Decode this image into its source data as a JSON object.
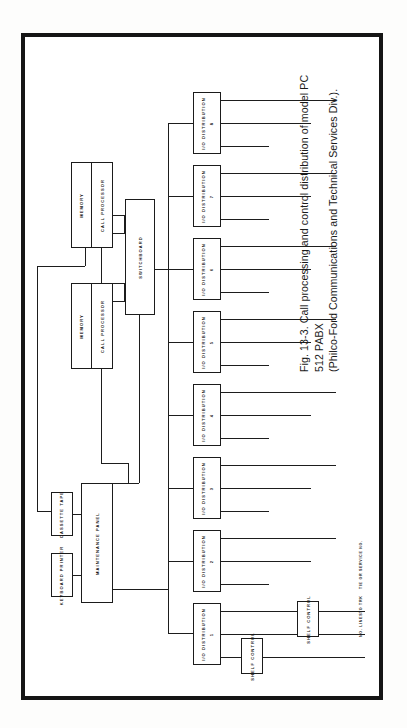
{
  "figure": {
    "caption_line1": "Fig. 13-3. Call processing and control distribution of model PC 512 PABX",
    "caption_line2": "(Philco-Ford Communications and Technical Services Div.)."
  },
  "blocks": {
    "memory_top": "MEMORY",
    "call_processor_top": "CALL PROCESSOR",
    "memory_bottom": "MEMORY",
    "call_processor_bottom": "CALL PROCESSOR",
    "switchboard": "SWITCHBOARD",
    "cassette_tape": "CASSETTE TAPE",
    "keyboard_printer": "KEYBOARD PRINTER",
    "maintenance_panel": "MAINTENANCE PANEL",
    "shelf_control_1": "SHELF CONTROL",
    "shelf_control_2": "SHELF CONTROL"
  },
  "io_distribution": [
    {
      "name": "I/O DISTRIBUTION",
      "number": "1"
    },
    {
      "name": "I/O DISTRIBUTION",
      "number": "2"
    },
    {
      "name": "I/O DISTRIBUTION",
      "number": "3"
    },
    {
      "name": "I/O DISTRIBUTION",
      "number": "4"
    },
    {
      "name": "I/O DISTRIBUTION",
      "number": "5"
    },
    {
      "name": "I/O DISTRIBUTION",
      "number": "6"
    },
    {
      "name": "I/O DISTRIBUTION",
      "number": "7"
    },
    {
      "name": "I/O DISTRIBUTION",
      "number": "8"
    }
  ],
  "edge_labels": {
    "lines": "NO. LINES",
    "trunks": "TO TRK",
    "tie_service": "TIE OR SERVICE NO."
  },
  "colors": {
    "ink": "#1b1b1b",
    "frame": "#151515",
    "paper": "#ffffff"
  }
}
